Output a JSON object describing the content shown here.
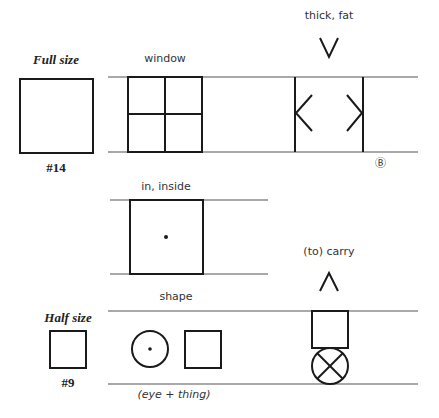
{
  "sizes": {
    "full": {
      "label": "Full size",
      "number": "#14"
    },
    "half": {
      "label": "Half size",
      "number": "#9"
    }
  },
  "symbols": [
    {
      "id": "window",
      "label": "window"
    },
    {
      "id": "thick-fat",
      "label": "thick, fat",
      "marker": "Ⓑ"
    },
    {
      "id": "inside",
      "label": "in, inside"
    },
    {
      "id": "shape",
      "label": "shape",
      "note": "(eye + thing)"
    },
    {
      "id": "carry",
      "label": "(to) carry"
    }
  ],
  "colors": {
    "ink": "#1a1a1a",
    "guideline": "#555555"
  }
}
